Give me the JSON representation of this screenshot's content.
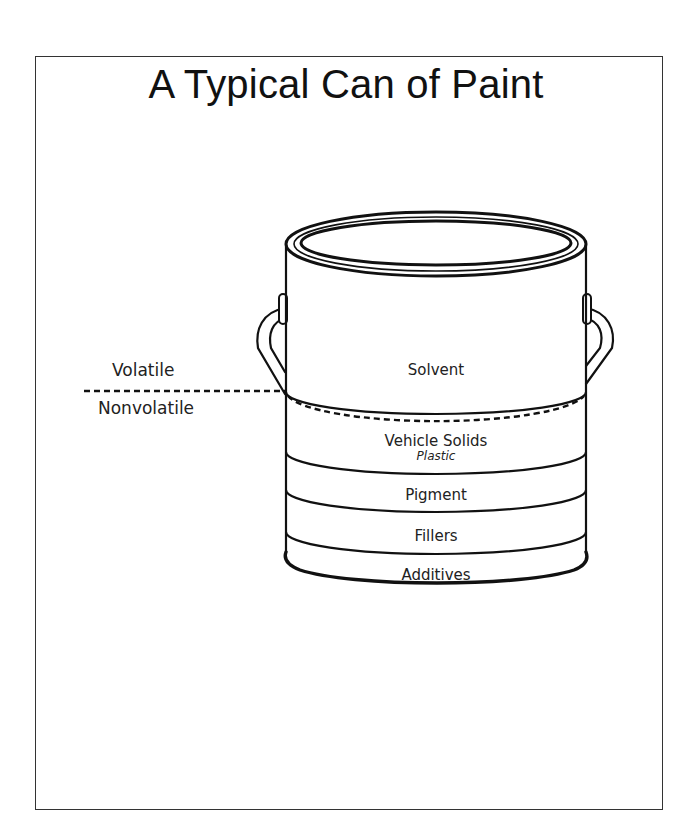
{
  "title": "A Typical Can of Paint",
  "side_labels": {
    "volatile": "Volatile",
    "nonvolatile": "Nonvolatile"
  },
  "layers": [
    {
      "name": "Solvent",
      "sub": ""
    },
    {
      "name": "Vehicle Solids",
      "sub": "Plastic"
    },
    {
      "name": "Pigment",
      "sub": ""
    },
    {
      "name": "Fillers",
      "sub": ""
    },
    {
      "name": "Additives",
      "sub": ""
    }
  ],
  "colors": {
    "ink": "#111111",
    "background": "#ffffff",
    "frame": "#333333"
  }
}
